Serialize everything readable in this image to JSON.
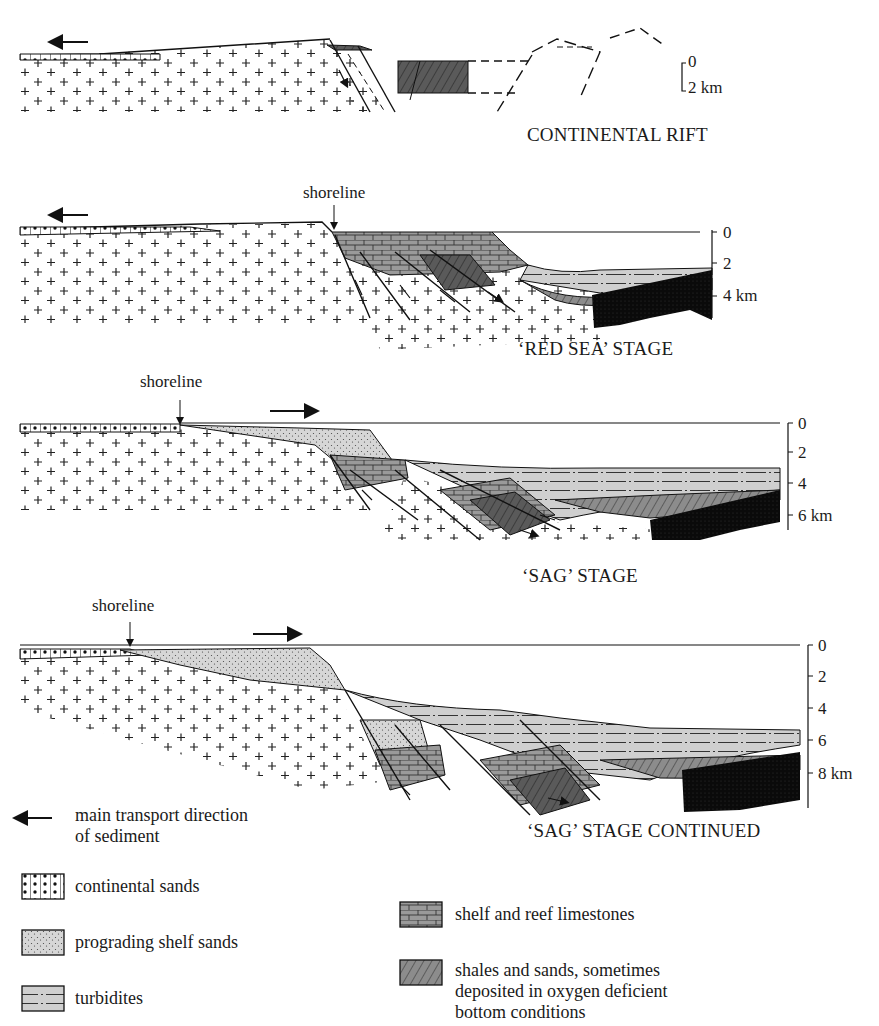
{
  "figure": {
    "panels": [
      {
        "title": "CONTINENTAL RIFT",
        "scale": [
          "0",
          "2  km"
        ]
      },
      {
        "title": "‘RED SEA’ STAGE",
        "shoreline_label": "shoreline",
        "scale": [
          "0",
          "2",
          "4  km"
        ]
      },
      {
        "title": "‘SAG’ STAGE",
        "shoreline_label": "shoreline",
        "scale": [
          "0",
          "2",
          "4",
          "6  km"
        ]
      },
      {
        "title": "‘SAG’ STAGE CONTINUED",
        "shoreline_label": "shoreline",
        "scale": [
          "0",
          "2",
          "4",
          "6",
          "8  km"
        ]
      }
    ],
    "legend": {
      "arrow": {
        "icon": "left-arrow-icon",
        "line1": "main transport direction",
        "line2": "of sediment"
      },
      "items": [
        {
          "pattern": "continental-sands-pattern",
          "label": "continental sands"
        },
        {
          "pattern": "prograding-shelf-sands-pattern",
          "label": "prograding shelf sands"
        },
        {
          "pattern": "turbidites-pattern",
          "label": "turbidites"
        },
        {
          "pattern": "limestone-pattern",
          "label": "shelf and reef limestones"
        },
        {
          "pattern": "shales-pattern",
          "label_lines": [
            "shales and sands, sometimes",
            "deposited in oxygen deficient",
            "bottom conditions"
          ]
        }
      ]
    }
  }
}
